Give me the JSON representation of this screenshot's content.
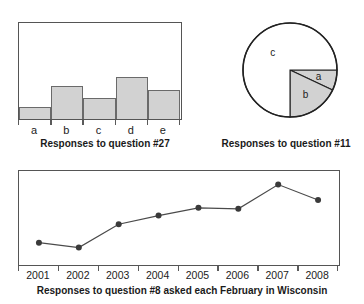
{
  "top_cropped_text": "",
  "figures": {
    "bar": {
      "caption": "Responses to question #27"
    },
    "pie": {
      "caption": "Responses to question #11"
    },
    "line": {
      "caption": "Responses to question #8 asked each February in Wisconsin"
    }
  },
  "chart_data": [
    {
      "type": "bar",
      "title": "Responses to question #27",
      "categories": [
        "a",
        "b",
        "c",
        "d",
        "e"
      ],
      "values": [
        12,
        34,
        22,
        43,
        30
      ],
      "xlabel": "",
      "ylabel": "",
      "ylim": [
        0,
        98
      ],
      "grid": false,
      "legend": false,
      "style": {
        "fill": "#d2d2d2",
        "stroke": "#6a6a6a",
        "frame": "#555555"
      }
    },
    {
      "type": "pie",
      "title": "Responses to question #11",
      "labels": [
        "a",
        "b",
        "c"
      ],
      "values": [
        7,
        18,
        75
      ],
      "start_angle_deg": 0,
      "grid": false,
      "legend": false,
      "style": {
        "slice_fill_shaded": "#d2d2d2",
        "slice_fill_plain": "#ffffff",
        "stroke": "#222222"
      }
    },
    {
      "type": "line",
      "title": "Responses to question #8 asked each February in Wisconsin",
      "x": [
        "2001",
        "2002",
        "2003",
        "2004",
        "2005",
        "2006",
        "2007",
        "2008"
      ],
      "values": [
        22,
        17,
        41,
        50,
        58,
        57,
        82,
        66
      ],
      "xlabel": "",
      "ylabel": "",
      "ylim": [
        0,
        96
      ],
      "grid": false,
      "legend": false,
      "markers": true,
      "style": {
        "line": "#4a4a4a",
        "marker": "#3a3a3a",
        "frame": "#555555"
      }
    }
  ]
}
